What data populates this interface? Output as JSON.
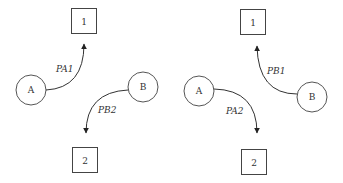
{
  "diagram": {
    "left": {
      "box_top": {
        "label": "1"
      },
      "box_bottom": {
        "label": "2"
      },
      "node_a": {
        "label": "A"
      },
      "node_b": {
        "label": "B"
      },
      "edge_a": {
        "label": "PA1",
        "from": "A",
        "to": "1"
      },
      "edge_b": {
        "label": "PB2",
        "from": "B",
        "to": "2"
      }
    },
    "right": {
      "box_top": {
        "label": "1"
      },
      "box_bottom": {
        "label": "2"
      },
      "node_a": {
        "label": "A"
      },
      "node_b": {
        "label": "B"
      },
      "edge_a": {
        "label": "PA2",
        "from": "A",
        "to": "2"
      },
      "edge_b": {
        "label": "PB1",
        "from": "B",
        "to": "1"
      }
    },
    "colors": {
      "stroke": "#333333",
      "background": "#ffffff"
    }
  }
}
